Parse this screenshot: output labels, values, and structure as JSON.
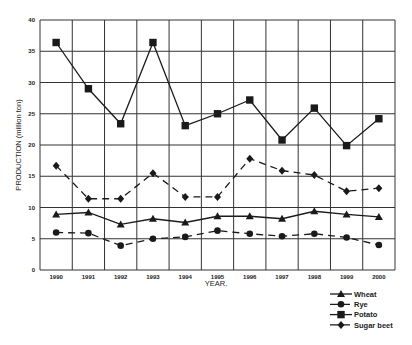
{
  "chart_data": {
    "type": "line",
    "title": "",
    "xlabel": "YEAR.",
    "ylabel": "PRODUCTION (million ton)",
    "ylim": [
      0,
      40
    ],
    "yticks": [
      0,
      5,
      10,
      15,
      20,
      25,
      30,
      35,
      40
    ],
    "grid": true,
    "legend_position": "bottom-right",
    "categories": [
      "1990",
      "1991",
      "1992",
      "1993",
      "1994",
      "1995",
      "1996",
      "1997",
      "1998",
      "1999",
      "2000"
    ],
    "series": [
      {
        "name": "Wheat",
        "marker": "triangle",
        "line": "solid",
        "values": [
          8.9,
          9.2,
          7.3,
          8.2,
          7.6,
          8.6,
          8.6,
          8.2,
          9.4,
          8.9,
          8.5
        ]
      },
      {
        "name": "Rye",
        "marker": "circle",
        "line": "dashed",
        "values": [
          6.0,
          5.9,
          3.9,
          5.0,
          5.3,
          6.3,
          5.8,
          5.4,
          5.8,
          5.2,
          4.0
        ]
      },
      {
        "name": "Potato",
        "marker": "square",
        "line": "solid",
        "values": [
          36.4,
          29.0,
          23.4,
          36.4,
          23.1,
          25.0,
          27.2,
          20.8,
          25.9,
          19.9,
          24.2
        ]
      },
      {
        "name": "Sugar beet",
        "marker": "diamond",
        "line": "dashed",
        "values": [
          16.7,
          11.4,
          11.4,
          15.5,
          11.7,
          11.7,
          17.8,
          15.9,
          15.2,
          12.6,
          13.1
        ]
      }
    ]
  }
}
